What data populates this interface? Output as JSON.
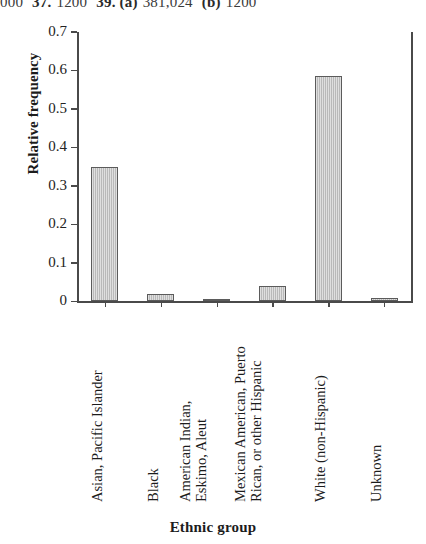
{
  "answer_key": {
    "segments": [
      {
        "text": "000",
        "bold": false
      },
      {
        "text": "37.",
        "bold": true
      },
      {
        "text": "1200",
        "bold": false
      },
      {
        "text": "39. (a)",
        "bold": true
      },
      {
        "text": "381,024",
        "bold": false
      },
      {
        "text": "(b)",
        "bold": true
      },
      {
        "text": "1200",
        "bold": false
      }
    ]
  },
  "chart_data": {
    "type": "bar",
    "title": "",
    "xlabel": "Ethnic group",
    "ylabel": "Relative frequency",
    "categories": [
      "Asian, Pacific Islander",
      "Black",
      "American Indian, Eskimo, Aleut",
      "Mexican American, Puerto Rican, or other Hispanic",
      "White (non-Hispanic)",
      "Unknown"
    ],
    "category_lines": [
      [
        "Asian, Pacific Islander"
      ],
      [
        "Black"
      ],
      [
        "American Indian,",
        "Eskimo, Aleut"
      ],
      [
        "Mexican American, Puerto",
        "Rican, or other Hispanic"
      ],
      [
        "White (non-Hispanic)"
      ],
      [
        "Unknown"
      ]
    ],
    "values": [
      0.35,
      0.018,
      0.003,
      0.04,
      0.585,
      0.008
    ],
    "ylim": [
      0,
      0.7
    ],
    "ytick_labels": [
      "0.7",
      "0.6",
      "0.5",
      "0.4",
      "0.3",
      "0.2",
      "0.1",
      "0"
    ],
    "ytick_values": [
      0.7,
      0.6,
      0.5,
      0.4,
      0.3,
      0.2,
      0.1,
      0
    ],
    "grid": false,
    "legend": "none",
    "bar_fill_color": "#b9b9b9",
    "bar_edge_color": "#5b5b5b",
    "axis_color": "#4a4a4a"
  }
}
